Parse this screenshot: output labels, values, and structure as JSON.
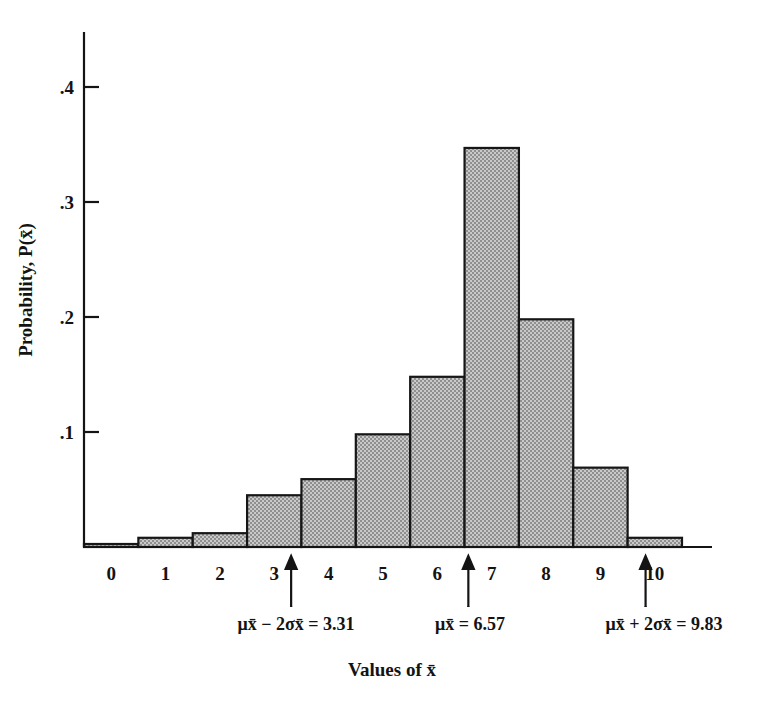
{
  "chart_data": {
    "type": "bar",
    "title": "",
    "subtitle": "",
    "xlabel": "Values of x̄",
    "ylabel": "Probability, P(x̄)",
    "categories": [
      "0",
      "1",
      "2",
      "3",
      "4",
      "5",
      "6",
      "7",
      "8",
      "9",
      "10"
    ],
    "values": [
      0.002,
      0.008,
      0.012,
      0.045,
      0.059,
      0.098,
      0.148,
      0.347,
      0.198,
      0.069,
      0.008
    ],
    "xlim": [
      -0.5,
      10.5
    ],
    "ylim": [
      0,
      0.44
    ],
    "ytick_values": [
      0.1,
      0.2,
      0.3,
      0.4
    ],
    "ytick_labels": [
      ".1",
      ".2",
      ".3",
      ".4"
    ],
    "xtick_labels": [
      "0",
      "1",
      "2",
      "3",
      "4",
      "5",
      "6",
      "7",
      "8",
      "9",
      "10"
    ],
    "grid": false,
    "legend": null,
    "bar_fill_color": "#a9a9a9",
    "bar_edge_color": "#161616",
    "axis_color": "#141414",
    "annotations": [
      {
        "name": "lower-2sigma",
        "label": "μx̄ − 2σx̄ = 3.31",
        "value": 3.31,
        "arrow_at_x": 3.31
      },
      {
        "name": "mean",
        "label": "μx̄ = 6.57",
        "value": 6.57,
        "arrow_at_x": 6.57
      },
      {
        "name": "upper-2sigma",
        "label": "μx̄ + 2σx̄ = 9.83",
        "value": 9.83,
        "arrow_at_x": 9.83
      }
    ]
  },
  "annotation_labels": {
    "lower": "μx̄ − 2σx̄ = 3.31",
    "mean": "μx̄ = 6.57",
    "upper": "μx̄ + 2σx̄ = 9.83"
  },
  "axis": {
    "y_label": "Probability, P(x̄)",
    "x_title": "Values of x̄",
    "y_ticks": [
      ".4",
      ".3",
      ".2",
      ".1"
    ],
    "x_ticks": [
      "0",
      "1",
      "2",
      "3",
      "4",
      "5",
      "6",
      "7",
      "8",
      "9",
      "10"
    ]
  }
}
